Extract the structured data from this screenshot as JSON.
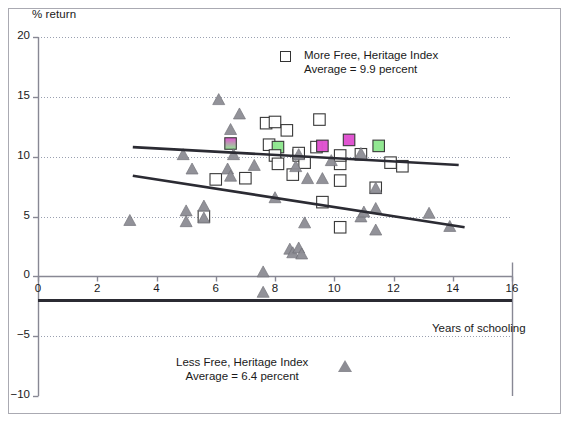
{
  "chart_data": {
    "type": "scatter",
    "title": "",
    "xlabel": "Years of schooling",
    "ylabel": "% return",
    "xlim": [
      0,
      16
    ],
    "ylim": [
      -10,
      20
    ],
    "xticks": [
      0,
      2,
      4,
      6,
      8,
      10,
      12,
      14,
      16
    ],
    "yticks": [
      20,
      15,
      10,
      5,
      0,
      -5,
      -10
    ],
    "grid": "horizontal-dotted",
    "legend_position": "inside-top-right and inside-bottom-center",
    "series": [
      {
        "name": "More Free, Heritage Index",
        "marker": "square",
        "average_label": "Average = 9.9 percent",
        "average": 9.9,
        "points": [
          {
            "x": 6.0,
            "y": 8.1
          },
          {
            "x": 6.5,
            "y": 11.1,
            "fill": "magenta-green"
          },
          {
            "x": 7.0,
            "y": 8.2
          },
          {
            "x": 7.7,
            "y": 12.8
          },
          {
            "x": 8.0,
            "y": 12.9
          },
          {
            "x": 7.8,
            "y": 11.0
          },
          {
            "x": 8.1,
            "y": 10.8,
            "fill": "green"
          },
          {
            "x": 8.0,
            "y": 10.1
          },
          {
            "x": 8.1,
            "y": 9.4
          },
          {
            "x": 8.4,
            "y": 12.2
          },
          {
            "x": 8.6,
            "y": 8.5
          },
          {
            "x": 8.8,
            "y": 10.1
          },
          {
            "x": 9.0,
            "y": 9.5
          },
          {
            "x": 9.5,
            "y": 13.1
          },
          {
            "x": 9.4,
            "y": 10.8
          },
          {
            "x": 9.6,
            "y": 10.9,
            "fill": "magenta"
          },
          {
            "x": 9.6,
            "y": 6.2
          },
          {
            "x": 10.2,
            "y": 9.4
          },
          {
            "x": 10.2,
            "y": 10.1
          },
          {
            "x": 10.2,
            "y": 8.0
          },
          {
            "x": 10.2,
            "y": 4.1
          },
          {
            "x": 10.5,
            "y": 11.4,
            "fill": "magenta"
          },
          {
            "x": 10.9,
            "y": 10.2
          },
          {
            "x": 11.5,
            "y": 10.9,
            "fill": "green"
          },
          {
            "x": 11.4,
            "y": 7.4
          },
          {
            "x": 11.9,
            "y": 9.5
          },
          {
            "x": 12.3,
            "y": 9.2
          },
          {
            "x": 5.6,
            "y": 5.0
          },
          {
            "x": 8.8,
            "y": 10.3
          }
        ]
      },
      {
        "name": "Less Free, Heritage Index",
        "marker": "triangle",
        "average_label": "Average = 6.4 percent",
        "average": 6.4,
        "points": [
          {
            "x": 3.1,
            "y": 4.6
          },
          {
            "x": 4.9,
            "y": 10.1
          },
          {
            "x": 5.0,
            "y": 5.4
          },
          {
            "x": 5.0,
            "y": 4.5
          },
          {
            "x": 5.2,
            "y": 8.9
          },
          {
            "x": 5.6,
            "y": 5.8
          },
          {
            "x": 5.6,
            "y": 4.8
          },
          {
            "x": 6.1,
            "y": 14.7
          },
          {
            "x": 6.4,
            "y": 8.9
          },
          {
            "x": 6.5,
            "y": 12.2
          },
          {
            "x": 6.5,
            "y": 8.3
          },
          {
            "x": 6.6,
            "y": 10.1
          },
          {
            "x": 6.8,
            "y": 13.5
          },
          {
            "x": 7.3,
            "y": 9.2
          },
          {
            "x": 7.6,
            "y": 0.3
          },
          {
            "x": 7.6,
            "y": -1.4
          },
          {
            "x": 8.0,
            "y": 6.5
          },
          {
            "x": 8.5,
            "y": 2.2
          },
          {
            "x": 8.6,
            "y": 1.9
          },
          {
            "x": 8.8,
            "y": 2.3
          },
          {
            "x": 8.9,
            "y": 1.8
          },
          {
            "x": 8.7,
            "y": 9.1
          },
          {
            "x": 8.8,
            "y": 10.1
          },
          {
            "x": 9.0,
            "y": 4.4
          },
          {
            "x": 9.1,
            "y": 8.1
          },
          {
            "x": 9.6,
            "y": 8.1
          },
          {
            "x": 9.9,
            "y": 9.6
          },
          {
            "x": 10.9,
            "y": 10.2
          },
          {
            "x": 10.9,
            "y": 4.9
          },
          {
            "x": 11.0,
            "y": 5.3
          },
          {
            "x": 11.4,
            "y": 5.6
          },
          {
            "x": 11.4,
            "y": 7.3
          },
          {
            "x": 11.4,
            "y": 3.8
          },
          {
            "x": 13.2,
            "y": 5.2
          },
          {
            "x": 13.9,
            "y": 4.1
          }
        ]
      }
    ],
    "trendlines": [
      {
        "name": "more-free-trend",
        "x0": 3.2,
        "y0": 10.8,
        "x1": 14.2,
        "y1": 9.3
      },
      {
        "name": "less-free-trend",
        "x0": 3.2,
        "y0": 8.4,
        "x1": 14.4,
        "y1": 4.1
      }
    ],
    "zero_baseline": {
      "y": -2.0
    }
  },
  "axes": {
    "ylabel": "% return",
    "xlabel": "Years of schooling",
    "yticks": [
      "20",
      "15",
      "10",
      "5",
      "0",
      "-5",
      "-10"
    ],
    "xticks": [
      "0",
      "2",
      "4",
      "6",
      "8",
      "10",
      "12",
      "14",
      "16"
    ]
  },
  "legend": {
    "more_free": {
      "line1": "More Free, Heritage Index",
      "line2": "Average = 9.9 percent"
    },
    "less_free": {
      "line1": "Less Free, Heritage Index",
      "line2": "Average = 6.4 percent"
    }
  },
  "colors": {
    "marker_triangle": "#8d8d94",
    "marker_square_edge": "#333333",
    "trendline": "#2b2b33",
    "grid": "#9aa0b0",
    "axis": "#888894",
    "fill_green": "#8fe88f",
    "fill_magenta": "#e050d0",
    "frame": "#aaaab2"
  }
}
